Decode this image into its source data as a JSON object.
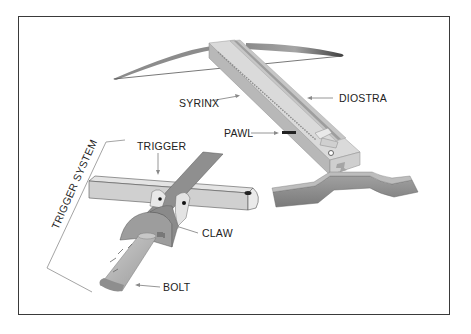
{
  "figure": {
    "labels": {
      "syrinx": "SYRINX",
      "diostra": "DIOSTRA",
      "pawl": "PAWL",
      "trigger": "TRIGGER",
      "trigger_system": "TRIGGER SYSTEM",
      "claw": "CLAW",
      "bolt": "BOLT"
    },
    "colors": {
      "frame": "#3a3a3a",
      "stock_light": "#d9d9d9",
      "stock_mid": "#bdbdbd",
      "stock_dark": "#9a9a9a",
      "bow": "#6e6e6e",
      "rest": "#8c8c8c",
      "arrow": "#8a8a8a"
    }
  }
}
